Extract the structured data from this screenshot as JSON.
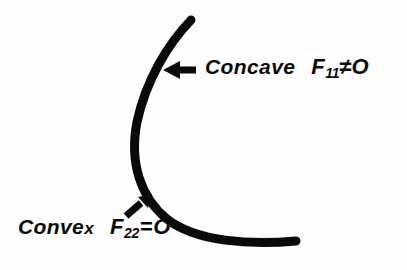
{
  "figure": {
    "background_color": "#fefefe",
    "ink_color": "#0a0a0a",
    "curve": {
      "name": "thick-black-arc",
      "description": "thick black arc opening to the right",
      "stroke_width_px": 9,
      "start_point": [
        191,
        20
      ],
      "end_point": [
        296,
        241
      ],
      "apex_point": [
        136,
        138
      ]
    },
    "annotations": {
      "concave": {
        "arrow": {
          "name": "left-pointing-arrow",
          "direction": "left",
          "tip": [
            164,
            70
          ],
          "tail": [
            197,
            70
          ]
        },
        "word": "Concave",
        "formula": {
          "symbol": "F",
          "subscript": "11",
          "relation": "≠",
          "value": "O"
        },
        "formula_text": "F11≠O"
      },
      "convex": {
        "arrow": {
          "name": "up-right-diagonal-arrow",
          "direction": "up-right",
          "tip": [
            151,
            194
          ],
          "tail": [
            125,
            216
          ]
        },
        "word": "Convex",
        "word_head": "Conve",
        "word_tail": "x",
        "formula": {
          "symbol": "F",
          "subscript": "22",
          "relation": "=",
          "value": "O"
        },
        "formula_text": "F22=O"
      }
    }
  }
}
